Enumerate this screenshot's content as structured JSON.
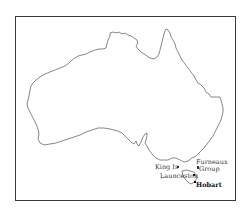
{
  "map": {
    "title": "Map of Australia",
    "region": "Australia",
    "labels": [
      {
        "id": "king-island",
        "text": "King Is"
      },
      {
        "id": "furneaux-1",
        "text": "Furneaux"
      },
      {
        "id": "furneaux-2",
        "text": "Group"
      },
      {
        "id": "launceston",
        "text": "Launceston"
      },
      {
        "id": "hobart",
        "text": "Hobart"
      }
    ],
    "colors": {
      "frame": "#3a3a3a",
      "coastline": "#555555",
      "background": "#ffffff"
    }
  }
}
